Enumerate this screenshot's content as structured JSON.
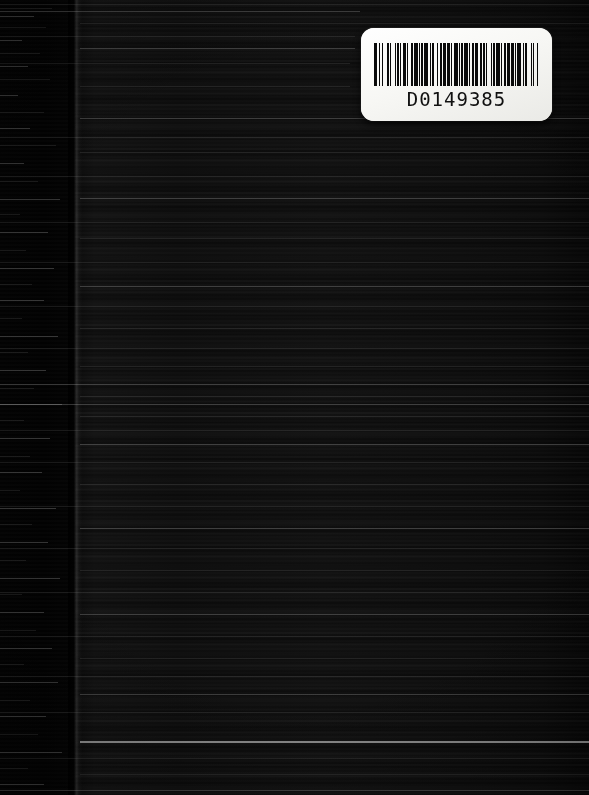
{
  "document": {
    "kind": "scanned-book-cover",
    "orientation": "portrait",
    "surface_description": "dark textured book board",
    "width_px": 589,
    "height_px": 795
  },
  "colors": {
    "cover_base": "#0d0d0d",
    "cover_deep_black": "#000000",
    "gutter_black": "#010101",
    "label_white": "#fbfbf9",
    "bar_black": "#0a0a0a",
    "streak_highlight": "#ebebeb"
  },
  "label": {
    "name": "barcode-label",
    "barcode_value": "D0149385",
    "symbology": "Code 39",
    "left_px": 361,
    "top_px": 28,
    "width_px": 191,
    "height_px": 93,
    "bars": [
      3,
      1,
      1,
      2,
      1,
      3,
      2,
      1,
      1,
      3,
      1,
      1,
      2,
      1,
      1,
      1,
      3,
      1,
      1,
      2,
      2,
      1,
      3,
      1,
      1,
      1,
      2,
      1,
      3,
      2,
      1,
      1,
      1,
      3,
      1,
      2,
      1,
      1,
      3,
      1,
      2,
      1,
      1,
      2,
      3,
      1,
      1,
      1,
      2,
      1,
      3,
      1,
      1,
      2,
      1,
      1,
      3,
      2,
      1,
      1,
      2,
      1,
      1,
      3,
      1,
      1,
      2,
      1,
      3,
      1,
      1,
      2,
      1,
      1,
      3,
      1,
      2,
      1,
      1,
      1,
      3,
      2,
      1,
      1,
      2,
      3,
      1,
      1,
      1,
      2,
      1,
      3
    ]
  },
  "spine": {
    "name": "spine-edge",
    "x_px": 75,
    "description": "vertical fold boundary between gutter and cover face"
  },
  "streaks": {
    "description": "horizontal scanner light streaks across the dark cover",
    "gutter": [
      {
        "y": 8,
        "x": 0,
        "w": 52,
        "cls": "faint"
      },
      {
        "y": 16,
        "x": 0,
        "w": 34,
        "cls": "soft"
      },
      {
        "y": 27,
        "x": 0,
        "w": 46,
        "cls": "faint"
      },
      {
        "y": 40,
        "x": 0,
        "w": 22,
        "cls": "soft"
      },
      {
        "y": 53,
        "x": 0,
        "w": 40,
        "cls": "faint"
      },
      {
        "y": 66,
        "x": 0,
        "w": 28,
        "cls": "soft"
      },
      {
        "y": 79,
        "x": 0,
        "w": 50,
        "cls": "faint"
      },
      {
        "y": 95,
        "x": 0,
        "w": 18,
        "cls": "soft"
      },
      {
        "y": 112,
        "x": 0,
        "w": 44,
        "cls": "faint"
      },
      {
        "y": 128,
        "x": 0,
        "w": 30,
        "cls": "soft"
      },
      {
        "y": 145,
        "x": 0,
        "w": 56,
        "cls": "faint"
      },
      {
        "y": 163,
        "x": 0,
        "w": 24,
        "cls": "soft"
      },
      {
        "y": 181,
        "x": 0,
        "w": 38,
        "cls": "faint"
      },
      {
        "y": 199,
        "x": 0,
        "w": 60,
        "cls": "soft"
      },
      {
        "y": 214,
        "x": 0,
        "w": 20,
        "cls": "faint"
      },
      {
        "y": 232,
        "x": 0,
        "w": 48,
        "cls": "soft"
      },
      {
        "y": 250,
        "x": 0,
        "w": 26,
        "cls": "faint"
      },
      {
        "y": 268,
        "x": 0,
        "w": 54,
        "cls": "soft"
      },
      {
        "y": 284,
        "x": 0,
        "w": 32,
        "cls": "faint"
      },
      {
        "y": 300,
        "x": 0,
        "w": 44,
        "cls": "soft"
      },
      {
        "y": 318,
        "x": 0,
        "w": 22,
        "cls": "faint"
      },
      {
        "y": 336,
        "x": 0,
        "w": 58,
        "cls": "soft"
      },
      {
        "y": 352,
        "x": 0,
        "w": 28,
        "cls": "faint"
      },
      {
        "y": 370,
        "x": 0,
        "w": 46,
        "cls": "soft"
      },
      {
        "y": 388,
        "x": 0,
        "w": 34,
        "cls": "faint"
      },
      {
        "y": 404,
        "x": 0,
        "w": 62,
        "cls": "soft"
      },
      {
        "y": 420,
        "x": 0,
        "w": 24,
        "cls": "faint"
      },
      {
        "y": 438,
        "x": 0,
        "w": 50,
        "cls": "soft"
      },
      {
        "y": 456,
        "x": 0,
        "w": 30,
        "cls": "faint"
      },
      {
        "y": 472,
        "x": 0,
        "w": 42,
        "cls": "soft"
      },
      {
        "y": 490,
        "x": 0,
        "w": 20,
        "cls": "faint"
      },
      {
        "y": 508,
        "x": 0,
        "w": 56,
        "cls": "soft"
      },
      {
        "y": 524,
        "x": 0,
        "w": 32,
        "cls": "faint"
      },
      {
        "y": 542,
        "x": 0,
        "w": 48,
        "cls": "soft"
      },
      {
        "y": 560,
        "x": 0,
        "w": 26,
        "cls": "faint"
      },
      {
        "y": 578,
        "x": 0,
        "w": 60,
        "cls": "soft"
      },
      {
        "y": 594,
        "x": 0,
        "w": 22,
        "cls": "faint"
      },
      {
        "y": 612,
        "x": 0,
        "w": 44,
        "cls": "soft"
      },
      {
        "y": 630,
        "x": 0,
        "w": 36,
        "cls": "faint"
      },
      {
        "y": 648,
        "x": 0,
        "w": 52,
        "cls": "soft"
      },
      {
        "y": 664,
        "x": 0,
        "w": 24,
        "cls": "faint"
      },
      {
        "y": 682,
        "x": 0,
        "w": 58,
        "cls": "soft"
      },
      {
        "y": 700,
        "x": 0,
        "w": 30,
        "cls": "faint"
      },
      {
        "y": 716,
        "x": 0,
        "w": 46,
        "cls": "soft"
      },
      {
        "y": 734,
        "x": 0,
        "w": 38,
        "cls": "faint"
      },
      {
        "y": 752,
        "x": 0,
        "w": 62,
        "cls": "soft"
      },
      {
        "y": 768,
        "x": 0,
        "w": 28,
        "cls": "faint"
      },
      {
        "y": 784,
        "x": 0,
        "w": 44,
        "cls": "soft"
      }
    ],
    "full_width": [
      {
        "y": 4,
        "x": 0,
        "w": 589,
        "cls": "faint"
      },
      {
        "y": 11,
        "x": 0,
        "w": 360,
        "cls": "soft"
      },
      {
        "y": 23,
        "x": 80,
        "w": 509,
        "cls": "faint"
      },
      {
        "y": 36,
        "x": 0,
        "w": 355,
        "cls": "faint"
      },
      {
        "y": 48,
        "x": 80,
        "w": 275,
        "cls": "soft"
      },
      {
        "y": 63,
        "x": 0,
        "w": 350,
        "cls": "faint"
      },
      {
        "y": 86,
        "x": 80,
        "w": 270,
        "cls": "faint"
      },
      {
        "y": 118,
        "x": 80,
        "w": 509,
        "cls": "soft"
      },
      {
        "y": 137,
        "x": 0,
        "w": 589,
        "cls": "faint"
      },
      {
        "y": 152,
        "x": 80,
        "w": 509,
        "cls": "faint"
      },
      {
        "y": 176,
        "x": 0,
        "w": 589,
        "cls": "faint"
      },
      {
        "y": 198,
        "x": 80,
        "w": 509,
        "cls": "soft"
      },
      {
        "y": 222,
        "x": 0,
        "w": 589,
        "cls": "faint"
      },
      {
        "y": 238,
        "x": 80,
        "w": 509,
        "cls": "faint"
      },
      {
        "y": 262,
        "x": 0,
        "w": 589,
        "cls": "faint"
      },
      {
        "y": 286,
        "x": 80,
        "w": 509,
        "cls": "soft"
      },
      {
        "y": 306,
        "x": 0,
        "w": 589,
        "cls": "faint"
      },
      {
        "y": 328,
        "x": 80,
        "w": 509,
        "cls": "faint"
      },
      {
        "y": 348,
        "x": 0,
        "w": 589,
        "cls": "faint"
      },
      {
        "y": 366,
        "x": 80,
        "w": 509,
        "cls": "faint"
      },
      {
        "y": 384,
        "x": 0,
        "w": 589,
        "cls": "soft"
      },
      {
        "y": 396,
        "x": 80,
        "w": 509,
        "cls": "faint"
      },
      {
        "y": 404,
        "x": 0,
        "w": 589,
        "cls": "soft"
      },
      {
        "y": 416,
        "x": 80,
        "w": 509,
        "cls": "faint"
      },
      {
        "y": 430,
        "x": 0,
        "w": 589,
        "cls": "faint"
      },
      {
        "y": 444,
        "x": 80,
        "w": 509,
        "cls": "soft"
      },
      {
        "y": 462,
        "x": 0,
        "w": 589,
        "cls": "faint"
      },
      {
        "y": 484,
        "x": 80,
        "w": 509,
        "cls": "faint"
      },
      {
        "y": 506,
        "x": 0,
        "w": 589,
        "cls": "faint"
      },
      {
        "y": 528,
        "x": 80,
        "w": 509,
        "cls": "soft"
      },
      {
        "y": 548,
        "x": 0,
        "w": 589,
        "cls": "faint"
      },
      {
        "y": 570,
        "x": 80,
        "w": 509,
        "cls": "faint"
      },
      {
        "y": 592,
        "x": 0,
        "w": 589,
        "cls": "faint"
      },
      {
        "y": 614,
        "x": 80,
        "w": 509,
        "cls": "soft"
      },
      {
        "y": 636,
        "x": 0,
        "w": 589,
        "cls": "faint"
      },
      {
        "y": 658,
        "x": 80,
        "w": 509,
        "cls": "faint"
      },
      {
        "y": 676,
        "x": 0,
        "w": 589,
        "cls": "faint"
      },
      {
        "y": 694,
        "x": 80,
        "w": 509,
        "cls": "soft"
      },
      {
        "y": 712,
        "x": 0,
        "w": 589,
        "cls": "faint"
      },
      {
        "y": 741,
        "x": 80,
        "w": 509,
        "cls": "bright"
      },
      {
        "y": 758,
        "x": 0,
        "w": 589,
        "cls": "faint"
      },
      {
        "y": 774,
        "x": 80,
        "w": 509,
        "cls": "faint"
      },
      {
        "y": 790,
        "x": 0,
        "w": 589,
        "cls": "soft"
      }
    ]
  }
}
